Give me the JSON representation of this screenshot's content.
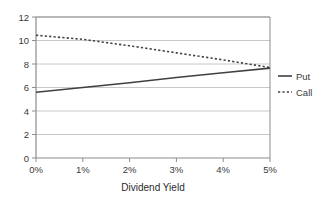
{
  "chart_data": {
    "type": "line",
    "title": "",
    "subtitle": "",
    "xlabel": "Dividend Yield",
    "ylabel": "",
    "x": [
      0,
      1,
      2,
      3,
      4,
      5
    ],
    "categories": [
      "0%",
      "1%",
      "2%",
      "3%",
      "4%",
      "5%"
    ],
    "xlim": [
      0,
      5
    ],
    "ylim": [
      0,
      12
    ],
    "yticks": [
      0,
      2,
      4,
      6,
      8,
      10,
      12
    ],
    "ytick_labels": [
      "0",
      "2",
      "4",
      "6",
      "8",
      "10",
      "12"
    ],
    "xtick_labels": [
      "0%",
      "1%",
      "2%",
      "3%",
      "4%",
      "5%"
    ],
    "grid": "horizontal",
    "legend_position": "right",
    "series": [
      {
        "name": "Put",
        "style": "solid",
        "color": "#404040",
        "values": [
          5.6,
          6.0,
          6.4,
          6.85,
          7.25,
          7.65
        ]
      },
      {
        "name": "Call",
        "style": "dotted",
        "color": "#404040",
        "values": [
          10.45,
          10.1,
          9.55,
          8.95,
          8.35,
          7.7
        ]
      }
    ],
    "annotations": []
  },
  "legend": {
    "items": [
      {
        "label": "Put",
        "style": "solid"
      },
      {
        "label": "Call",
        "style": "dotted"
      }
    ]
  },
  "axes": {
    "x_title": "Dividend Yield"
  },
  "colors": {
    "plot_border": "#8c8c8c",
    "gridline": "#c8c8c8",
    "series_line": "#404040",
    "tick_text": "#3a3a3a",
    "background": "#ffffff"
  }
}
